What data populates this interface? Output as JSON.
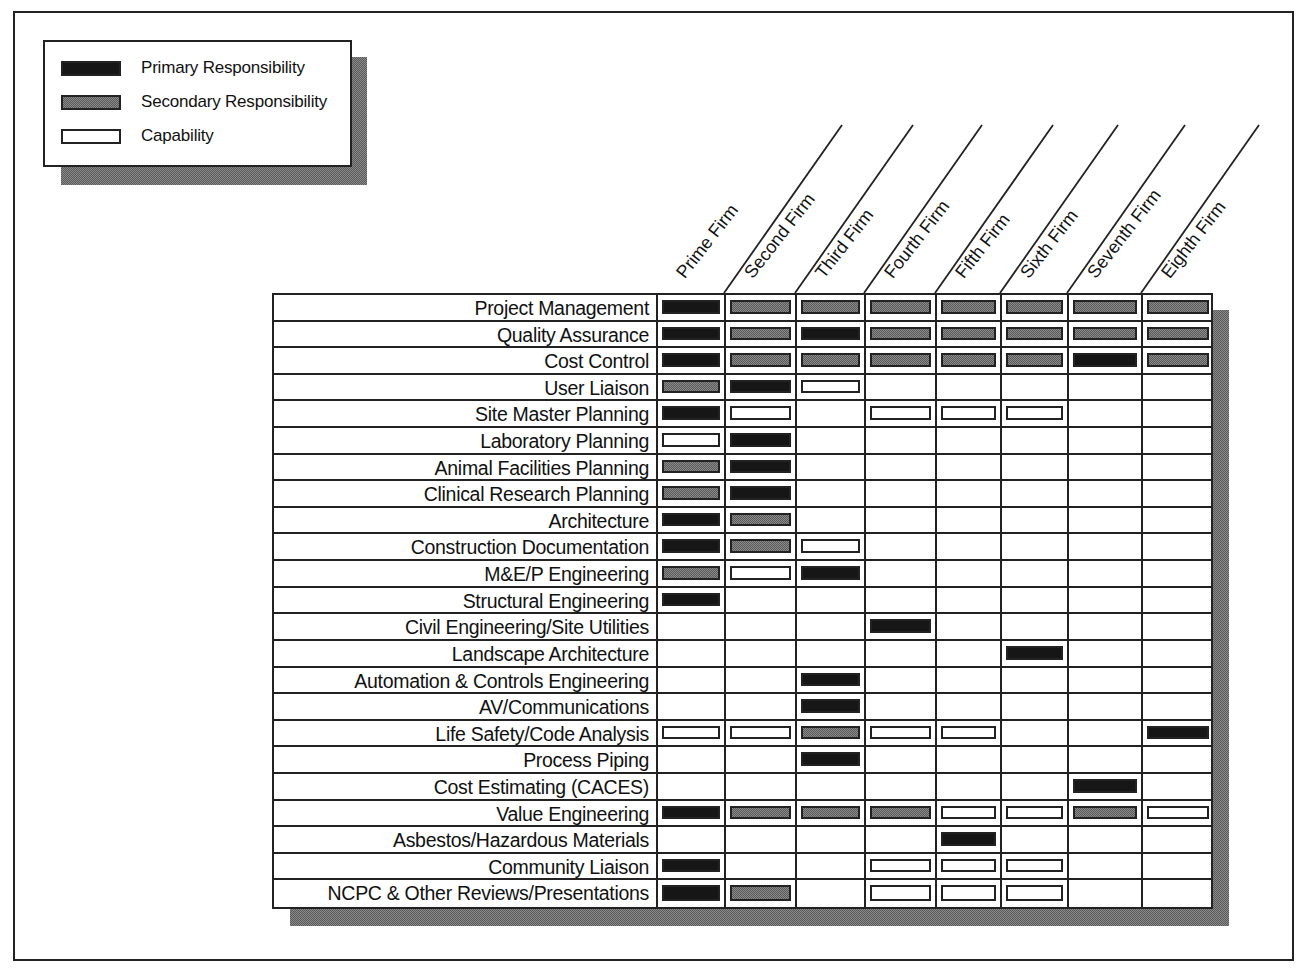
{
  "legend": {
    "items": [
      {
        "key": "primary",
        "label": "Primary Responsibility"
      },
      {
        "key": "secondary",
        "label": "Secondary Responsibility"
      },
      {
        "key": "capability",
        "label": "Capability"
      }
    ]
  },
  "columns": [
    "Prime Firm",
    "Second Firm",
    "Third Firm",
    "Fourth Firm",
    "Fifth Firm",
    "Sixth Firm",
    "Seventh Firm",
    "Eighth Firm"
  ],
  "rows": [
    {
      "label": "Project Management",
      "cells": [
        "P",
        "S",
        "S",
        "S",
        "S",
        "S",
        "S",
        "S"
      ]
    },
    {
      "label": "Quality Assurance",
      "cells": [
        "P",
        "S",
        "P",
        "S",
        "S",
        "S",
        "S",
        "S"
      ]
    },
    {
      "label": "Cost Control",
      "cells": [
        "P",
        "S",
        "S",
        "S",
        "S",
        "S",
        "P",
        "S"
      ]
    },
    {
      "label": "User Liaison",
      "cells": [
        "S",
        "P",
        "C",
        "",
        "",
        "",
        "",
        ""
      ]
    },
    {
      "label": "Site Master Planning",
      "cells": [
        "P",
        "C",
        "",
        "C",
        "C",
        "C",
        "",
        ""
      ]
    },
    {
      "label": "Laboratory Planning",
      "cells": [
        "C",
        "P",
        "",
        "",
        "",
        "",
        "",
        ""
      ]
    },
    {
      "label": "Animal Facilities Planning",
      "cells": [
        "S",
        "P",
        "",
        "",
        "",
        "",
        "",
        ""
      ]
    },
    {
      "label": "Clinical Research Planning",
      "cells": [
        "S",
        "P",
        "",
        "",
        "",
        "",
        "",
        ""
      ]
    },
    {
      "label": "Architecture",
      "cells": [
        "P",
        "S",
        "",
        "",
        "",
        "",
        "",
        ""
      ]
    },
    {
      "label": "Construction Documentation",
      "cells": [
        "P",
        "S",
        "C",
        "",
        "",
        "",
        "",
        ""
      ]
    },
    {
      "label": "M&E/P Engineering",
      "cells": [
        "S",
        "C",
        "P",
        "",
        "",
        "",
        "",
        ""
      ]
    },
    {
      "label": "Structural Engineering",
      "cells": [
        "P",
        "",
        "",
        "",
        "",
        "",
        "",
        ""
      ]
    },
    {
      "label": "Civil Engineering/Site Utilities",
      "cells": [
        "",
        "",
        "",
        "P",
        "",
        "",
        "",
        ""
      ]
    },
    {
      "label": "Landscape Architecture",
      "cells": [
        "",
        "",
        "",
        "",
        "",
        "P",
        "",
        ""
      ]
    },
    {
      "label": "Automation & Controls Engineering",
      "cells": [
        "",
        "",
        "P",
        "",
        "",
        "",
        "",
        ""
      ]
    },
    {
      "label": "AV/Communications",
      "cells": [
        "",
        "",
        "P",
        "",
        "",
        "",
        "",
        ""
      ]
    },
    {
      "label": "Life Safety/Code Analysis",
      "cells": [
        "C",
        "C",
        "S",
        "C",
        "C",
        "",
        "",
        "P"
      ]
    },
    {
      "label": "Process Piping",
      "cells": [
        "",
        "",
        "P",
        "",
        "",
        "",
        "",
        ""
      ]
    },
    {
      "label": "Cost Estimating (CACES)",
      "cells": [
        "",
        "",
        "",
        "",
        "",
        "",
        "P",
        ""
      ]
    },
    {
      "label": "Value Engineering",
      "cells": [
        "P",
        "S",
        "S",
        "S",
        "C",
        "C",
        "S",
        "C"
      ]
    },
    {
      "label": "Asbestos/Hazardous Materials",
      "cells": [
        "",
        "",
        "",
        "",
        "P",
        "",
        "",
        ""
      ]
    },
    {
      "label": "Community Liaison",
      "cells": [
        "P",
        "",
        "",
        "C",
        "C",
        "C",
        "",
        ""
      ]
    },
    {
      "label": "NCPC & Other Reviews/Presentations",
      "cells": [
        "P",
        "S",
        "",
        "C",
        "C",
        "C",
        "",
        ""
      ]
    }
  ],
  "cell_codes": {
    "P": "Primary Responsibility",
    "S": "Secondary Responsibility",
    "C": "Capability",
    "": "None"
  },
  "colors": {
    "primary": "#161616",
    "secondary_pattern": "#8a8a8a",
    "capability": "#ffffff",
    "border": "#222222"
  }
}
